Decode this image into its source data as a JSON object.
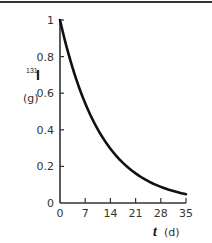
{
  "chart_data": {
    "type": "line",
    "title": "",
    "xlabel": "t (d)",
    "ylabel": "131I (g)",
    "x_var": "t",
    "x_unit": "(d)",
    "y_isotope_mass_number": "131",
    "y_element": "I",
    "y_unit": "(g)",
    "xlim": [
      0,
      35
    ],
    "ylim": [
      0,
      1
    ],
    "xticks": [
      0,
      7,
      14,
      21,
      28,
      35
    ],
    "yticks": [
      0,
      0.2,
      0.4,
      0.6,
      0.8,
      1
    ],
    "xtick_labels": [
      "0",
      "7",
      "14",
      "21",
      "28",
      "35"
    ],
    "ytick_labels": [
      "0",
      "0.2",
      "0.4",
      "0.6",
      "0.8",
      "1"
    ],
    "grid": false,
    "legend": null,
    "series": [
      {
        "name": "131I mass",
        "color": "#111111",
        "x": [
          0,
          3.5,
          7,
          10.5,
          14,
          17.5,
          21,
          24.5,
          28,
          31.5,
          35
        ],
        "values": [
          1.0,
          0.74,
          0.545,
          0.4,
          0.297,
          0.22,
          0.162,
          0.12,
          0.088,
          0.065,
          0.048
        ]
      }
    ]
  }
}
